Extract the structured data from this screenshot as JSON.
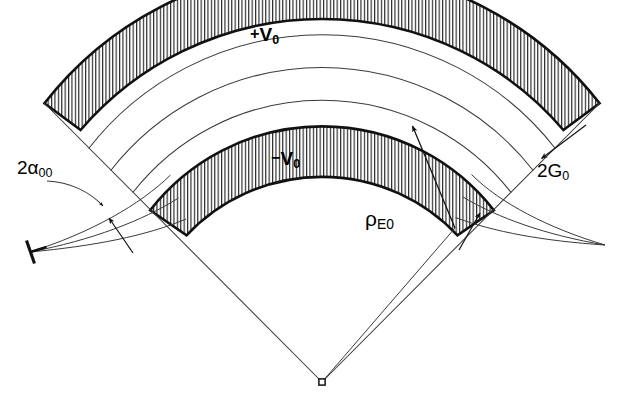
{
  "figure": {
    "kind": "technical-line-drawing",
    "background_color": "#ffffff",
    "ink_color": "#000000",
    "thin_line_color": "#3a3a3a",
    "width": 625,
    "height": 404
  },
  "labels": {
    "outer_electrode": {
      "sign": "+",
      "symbol": "V",
      "subscript": "0",
      "text": "+V0"
    },
    "inner_electrode": {
      "sign": "−",
      "symbol": "V",
      "subscript": "0",
      "text": "−V0"
    },
    "half_angle": {
      "prefix": "2",
      "symbol": "α",
      "subscript": "00",
      "text": "2α00"
    },
    "gap": {
      "prefix": "2",
      "symbol": "G",
      "subscript": "0",
      "text": "2G0"
    },
    "mean_radius": {
      "symbol": "ρ",
      "subscript": "E0",
      "text": "ρE0"
    }
  },
  "geometry": {
    "center_of_curvature": {
      "x": 322,
      "y": 382,
      "marker": "small-square"
    },
    "left_focus": {
      "x": 30,
      "y": 252,
      "marker": "slit-bar"
    },
    "right_focus": {
      "x": 605,
      "y": 245,
      "marker": "convergence-point"
    },
    "radii": {
      "outer_electrode_outer": 352,
      "outer_electrode_inner": 318,
      "trajectory_outer": 296,
      "trajectory_mean": 268,
      "trajectory_inner": 240,
      "inner_electrode_outer": 218,
      "inner_electrode_inner": 186
    },
    "sector_half_angle_deg": 52,
    "hatch": {
      "style": "vertical-line-fill",
      "spacing_px": 3.4,
      "line_width_px": 1
    },
    "trajectory_arc_count": 3
  },
  "annotations": {
    "rho_arrow": {
      "from": {
        "x": 455,
        "y": 228
      },
      "to": {
        "x": 411,
        "y": 124
      },
      "head": "to"
    },
    "gap_arrow": {
      "from": {
        "x": 583,
        "y": 128
      },
      "to": {
        "x": 540,
        "y": 160
      },
      "head": "to"
    },
    "angle_leader": {
      "from": {
        "x": 47,
        "y": 181
      },
      "to": {
        "x": 104,
        "y": 207
      },
      "head": "to",
      "curved": true
    },
    "left_gap_arrow": {
      "from": {
        "x": 133,
        "y": 253
      },
      "to": {
        "x": 108,
        "y": 216
      },
      "head": "to"
    },
    "right_gap_arrow": {
      "from": {
        "x": 459,
        "y": 250
      },
      "to": {
        "x": 481,
        "y": 211
      },
      "head": "to"
    }
  },
  "label_positions": {
    "outer_electrode": {
      "x": 250,
      "y": 24
    },
    "inner_electrode": {
      "x": 271,
      "y": 148
    },
    "half_angle": {
      "x": 17,
      "y": 157
    },
    "gap": {
      "x": 537,
      "y": 160
    },
    "mean_radius": {
      "x": 365,
      "y": 207
    }
  }
}
